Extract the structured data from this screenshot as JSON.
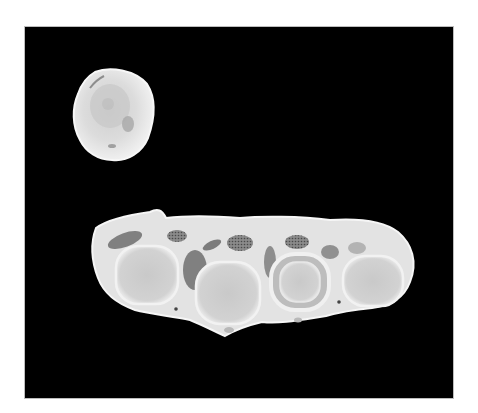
{
  "image": {
    "description": "Photograph of two pale anatomical cross-section specimens on a black background",
    "background_color": "#000000",
    "page_color": "#ffffff",
    "specimens": [
      {
        "name": "small-round-section",
        "color": "#e6e6e6"
      },
      {
        "name": "elongated-section-with-four-round-structures",
        "color": "#e4e4e4",
        "structure_count": 4
      }
    ]
  }
}
